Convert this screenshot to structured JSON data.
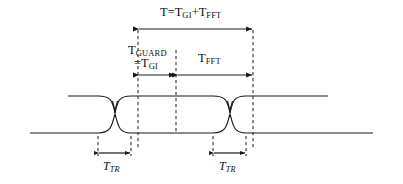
{
  "figure": {
    "name": "ofdm-symbol-timing-diagram",
    "type": "signal-timing-eye-diagram",
    "stroke_color": "#1a1a1a",
    "dash_color": "#1a1a1a",
    "background": "#ffffff"
  },
  "labels": {
    "total_symbol": {
      "base": "T=T",
      "sub1": "GI",
      "mid": "+T",
      "sub2": "FFT"
    },
    "guard": {
      "base": "T",
      "sub": "GUARD"
    },
    "guard_alt": {
      "base": "=T",
      "sub": "GI"
    },
    "fft": {
      "base": "T",
      "sub": "FFT"
    },
    "transition_left": {
      "base": "T",
      "sub": "TR"
    },
    "transition_right": {
      "base": "T",
      "sub": "TR"
    }
  },
  "geometry": {
    "upper_baseline_y": 96,
    "lower_baseline_y": 133,
    "crossing_left_x": 115,
    "crossing_right_x": 230,
    "dashed_guard_start_x": 138,
    "dashed_center_x": 176,
    "dashed_end_x": 253,
    "arrow_total_y": 29,
    "arrow_mid_y": 75,
    "arrow_tr_y": 153,
    "tr_left_ticks": [
      98,
      131
    ],
    "tr_right_ticks": [
      213,
      246
    ]
  }
}
